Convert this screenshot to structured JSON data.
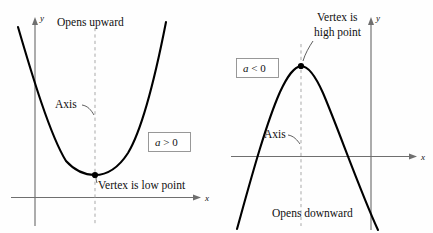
{
  "figure": {
    "background_color": "#fefefe",
    "curve_color": "#000000",
    "axis_color": "#6f6f6f",
    "dashed_axis_color": "#a9a9a9",
    "box_border_color": "#8e8e8e"
  },
  "left_panel": {
    "name": "opens-upward-parabola",
    "orientation_label": "Opens upward",
    "axis_label": "Axis",
    "vertex_label": "Vertex is low point",
    "coefficient_label": "a > 0",
    "coefficient_variable": "a",
    "coefficient_relation": "> 0",
    "x_axis_label": "x",
    "y_axis_label": "y"
  },
  "right_panel": {
    "name": "opens-downward-parabola",
    "orientation_label": "Opens downward",
    "axis_label": "Axis",
    "vertex_label_line1": "Vertex is",
    "vertex_label_line2": "high point",
    "coefficient_label": "a < 0",
    "coefficient_variable": "a",
    "coefficient_relation": "< 0",
    "x_axis_label": "x",
    "y_axis_label": "y"
  },
  "chart_data": {
    "type": "line",
    "xlabel": "x",
    "ylabel": "y",
    "grid": false,
    "legend": "none",
    "series": [
      {
        "name": "Opens upward (a > 0)",
        "panel": "left",
        "vertex": [
          95,
          175
        ],
        "opens": "upward",
        "coefficient_sign": "positive",
        "annotations": [
          "Opens upward",
          "Axis",
          "Vertex is low point",
          "a > 0"
        ]
      },
      {
        "name": "Opens downward (a < 0)",
        "panel": "right",
        "vertex": [
          301,
          66
        ],
        "opens": "downward",
        "coefficient_sign": "negative",
        "annotations": [
          "Opens downward",
          "Axis",
          "Vertex is high point",
          "a < 0"
        ]
      }
    ]
  }
}
